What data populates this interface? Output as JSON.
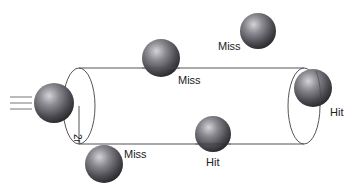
{
  "diagram": {
    "radius_label": "2r",
    "colors": {
      "line": "#555555",
      "text": "#222222",
      "sphere_light": "#c8c8cc",
      "sphere_mid": "#6e6e74",
      "sphere_dark": "#2e2e32"
    },
    "moving_sphere": {
      "label": "",
      "cx": 54,
      "cy": 103,
      "r": 20
    },
    "spheres": [
      {
        "id": "miss-top-center",
        "label": "Miss",
        "cx": 161,
        "cy": 58,
        "r": 19,
        "label_x": 178,
        "label_y": 84
      },
      {
        "id": "miss-top-right",
        "label": "Miss",
        "cx": 258,
        "cy": 31,
        "r": 18,
        "label_x": 218,
        "label_y": 50
      },
      {
        "id": "hit-right",
        "label": "Hit",
        "cx": 313,
        "cy": 88,
        "r": 19,
        "label_x": 330,
        "label_y": 116
      },
      {
        "id": "hit-bottom",
        "label": "Hit",
        "cx": 213,
        "cy": 134,
        "r": 18,
        "label_x": 206,
        "label_y": 166
      },
      {
        "id": "miss-bottom-left",
        "label": "Miss",
        "cx": 104,
        "cy": 164,
        "r": 19,
        "label_x": 124,
        "label_y": 158
      }
    ],
    "cylinder": {
      "left_cx": 79,
      "right_cx": 304,
      "cy": 106,
      "rx": 16,
      "ry": 38
    }
  }
}
